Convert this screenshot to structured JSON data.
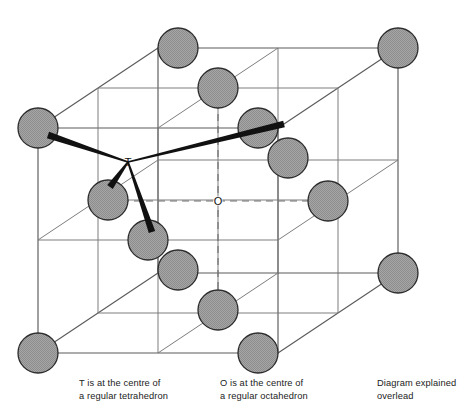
{
  "figure": {
    "type": "crystal-structure-diagram",
    "name": "face-centred-cubic-unit-cell",
    "title_fragment_cut_off": "( . . . )",
    "labels": {
      "tetrahedral_site": "T",
      "octahedral_site": "O"
    },
    "colors": {
      "atom_fill": "#9d9d9d",
      "atom_stroke": "#2b2b2b",
      "cell_edge": "#5a5a5a",
      "hidden_edge_dash": "#6e6e6e",
      "bond": "#111111",
      "background": "#ffffff",
      "text": "#222222"
    },
    "geometry": {
      "origin_front_bottom_left": [
        118,
        288
      ],
      "edge_px": 240,
      "depth_dx": 80,
      "depth_dy": -80,
      "atom_radius_px": 20,
      "tetrahedral_site_px": [
        128,
        162
      ],
      "octahedral_site_px": [
        218,
        201
      ]
    },
    "atoms": [
      {
        "id": "corner-back-top-left",
        "cx": 38,
        "cy": 128,
        "kind": "corner"
      },
      {
        "id": "corner-back-top-midz",
        "cx": 178,
        "cy": 48,
        "kind": "corner"
      },
      {
        "id": "corner-back-top-right",
        "cx": 398,
        "cy": 48,
        "kind": "corner"
      },
      {
        "id": "face-top-centre",
        "cx": 218,
        "cy": 88,
        "kind": "face"
      },
      {
        "id": "face-back-centre",
        "cx": 258,
        "cy": 128,
        "kind": "face"
      },
      {
        "id": "face-left-centre",
        "cx": 108,
        "cy": 200,
        "kind": "face"
      },
      {
        "id": "face-centre-upper-right",
        "cx": 288,
        "cy": 158,
        "kind": "face"
      },
      {
        "id": "face-right-centre",
        "cx": 328,
        "cy": 201,
        "kind": "face"
      },
      {
        "id": "face-front-centre",
        "cx": 148,
        "cy": 240,
        "kind": "face"
      },
      {
        "id": "face-lower-left",
        "cx": 178,
        "cy": 270,
        "kind": "face"
      },
      {
        "id": "face-bottom-centre",
        "cx": 218,
        "cy": 310,
        "kind": "face"
      },
      {
        "id": "corner-front-bottom-left",
        "cx": 38,
        "cy": 353,
        "kind": "corner"
      },
      {
        "id": "corner-bottom-mid",
        "cx": 258,
        "cy": 353,
        "kind": "corner"
      },
      {
        "id": "corner-bottom-right",
        "cx": 398,
        "cy": 273,
        "kind": "corner"
      }
    ],
    "bonds_from_T": [
      {
        "to": "corner-back-top-left",
        "x2": 48,
        "y2": 135
      },
      {
        "to": "face-centre-upper-right",
        "x2": 284,
        "y2": 124
      },
      {
        "to": "face-left-centre",
        "x2": 110,
        "y2": 187
      },
      {
        "to": "face-front-centre",
        "x2": 152,
        "y2": 232
      }
    ],
    "captions": {
      "tetrahedral": "T is at the centre of\na regular tetrahedron",
      "octahedral": "O is at the centre of\na regular octahedron",
      "note": "Diagram explained\noverlead"
    }
  }
}
